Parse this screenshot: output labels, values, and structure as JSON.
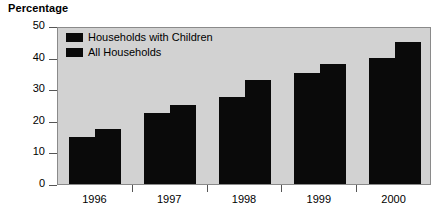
{
  "chart_data": {
    "type": "bar",
    "title": "Percentage",
    "xlabel": "",
    "ylabel": "",
    "ylim": [
      0,
      50
    ],
    "yticks": [
      0,
      10,
      20,
      30,
      40,
      50
    ],
    "ytick_labels": [
      "0",
      "10",
      "20",
      "30",
      "40",
      "50"
    ],
    "grid": false,
    "legend_position": "top-left-inside",
    "categories": [
      "1996",
      "1997",
      "1998",
      "1999",
      "2000"
    ],
    "series": [
      {
        "name": "Households with Children",
        "color": "#0a0a0a",
        "values": [
          15,
          22.5,
          27.5,
          35,
          40
        ]
      },
      {
        "name": "All Households",
        "color": "#0a0a0a",
        "values": [
          17.5,
          25,
          33,
          38,
          45
        ]
      }
    ]
  },
  "colors": {
    "plot_background": "#d2d2d2",
    "bar": "#0a0a0a",
    "axis": "#555555",
    "text": "#000000",
    "page_background": "#ffffff"
  },
  "caption": {
    "clipped_text": ""
  }
}
